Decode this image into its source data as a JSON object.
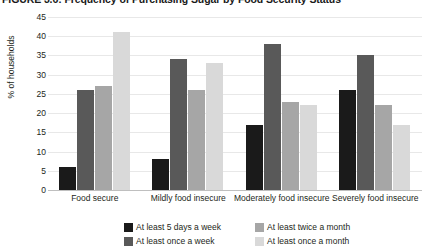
{
  "chart_data": {
    "type": "bar",
    "title": "FIGURE 3.6: Frequency of Purchasing Sugar by Food Security Status",
    "xlabel": "",
    "ylabel": "% of households",
    "ylim": [
      0,
      45
    ],
    "ytick_step": 5,
    "yticks": [
      45,
      40,
      35,
      30,
      25,
      20,
      15,
      10,
      5,
      0
    ],
    "grid": true,
    "legend_position": "bottom",
    "categories": [
      "Food secure",
      "Mildly food insecure",
      "Moderately food insecure",
      "Severely food insecure"
    ],
    "series": [
      {
        "name": "At least 5 days a week",
        "color": "#1a1a1a",
        "values": [
          6,
          8,
          17,
          26
        ]
      },
      {
        "name": "At least once a week",
        "color": "#595959",
        "values": [
          26,
          34,
          38,
          35
        ]
      },
      {
        "name": "At least twice a month",
        "color": "#a6a6a6",
        "values": [
          27,
          26,
          23,
          22
        ]
      },
      {
        "name": "At least once a month",
        "color": "#d9d9d9",
        "values": [
          41,
          33,
          22,
          17
        ]
      }
    ]
  }
}
